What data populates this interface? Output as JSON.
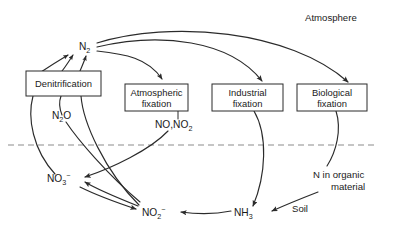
{
  "figure": {
    "canvas": {
      "width": 393,
      "height": 237
    },
    "background_color": "#ffffff",
    "line_color": "#2b2b2b",
    "boundary_color": "#8c8c8c"
  },
  "zones": {
    "atmosphere": {
      "label": "Atmosphere",
      "x": 305,
      "y": 21
    },
    "soil": {
      "label": "Soil",
      "x": 292,
      "y": 212
    }
  },
  "boundary": {
    "name": "atmosphere-soil-boundary",
    "style": "dashed",
    "y": 145,
    "x_start": 8,
    "x_end": 376
  },
  "process_boxes": [
    {
      "id": "denitrification",
      "lines": [
        "Denitrification"
      ],
      "x": 26,
      "y": 71,
      "w": 75,
      "h": 25
    },
    {
      "id": "atmospheric-fixation",
      "lines": [
        "Atmospheric",
        "fixation"
      ],
      "x": 125,
      "y": 84,
      "w": 63,
      "h": 27
    },
    {
      "id": "industrial-fixation",
      "lines": [
        "Industrial",
        "fixation"
      ],
      "x": 212,
      "y": 84,
      "w": 71,
      "h": 27
    },
    {
      "id": "biological-fixation",
      "lines": [
        "Biological",
        "fixation"
      ],
      "x": 297,
      "y": 84,
      "w": 70,
      "h": 27
    }
  ],
  "species": [
    {
      "id": "n2",
      "base": "N",
      "sub": "2",
      "sup": "",
      "x": 79,
      "y": 50
    },
    {
      "id": "n2o",
      "base": "N",
      "sub": "2",
      "sup": "",
      "tail": "O",
      "x": 52,
      "y": 119
    },
    {
      "id": "no-no2",
      "base": "NO,NO",
      "sub": "2",
      "sup": "",
      "x": 155,
      "y": 128
    },
    {
      "id": "no3",
      "base": "NO",
      "sub": "3",
      "sup": "−",
      "x": 47,
      "y": 182
    },
    {
      "id": "no2",
      "base": "NO",
      "sub": "2",
      "sup": "−",
      "x": 142,
      "y": 216
    },
    {
      "id": "nh3",
      "base": "NH",
      "sub": "3",
      "sup": "",
      "x": 234,
      "y": 216
    }
  ],
  "organic": {
    "id": "n-in-organic-material",
    "line1": "N in organic",
    "line2": "material",
    "x": 313,
    "y": 178
  },
  "flows": [
    {
      "id": "n2-to-atmospheric-fixation",
      "from": "n2",
      "to": "atmospheric-fixation"
    },
    {
      "id": "n2-to-industrial-fixation",
      "from": "n2",
      "to": "industrial-fixation"
    },
    {
      "id": "n2-to-biological-fixation",
      "from": "n2",
      "to": "biological-fixation"
    },
    {
      "id": "denitrification-to-n2-a",
      "from": "denitrification",
      "to": "n2"
    },
    {
      "id": "denitrification-to-n2-b",
      "from": "denitrification",
      "to": "n2"
    },
    {
      "id": "denitrification-to-n2-c",
      "from": "denitrification",
      "to": "n2"
    },
    {
      "id": "denitrification-to-no3",
      "from": "denitrification",
      "to": "no3"
    },
    {
      "id": "denitrification-n2o-branch",
      "from": "denitrification",
      "to": "no2"
    },
    {
      "id": "denitrification-to-no2",
      "from": "denitrification",
      "to": "no2"
    },
    {
      "id": "atmospheric-fixation-to-no3",
      "from": "no-no2",
      "to": "no3"
    },
    {
      "id": "industrial-fixation-to-nh3",
      "from": "industrial-fixation",
      "to": "nh3"
    },
    {
      "id": "biological-fixation-to-organic",
      "from": "biological-fixation",
      "to": "n-in-organic-material"
    },
    {
      "id": "organic-to-nh3",
      "from": "n-in-organic-material",
      "to": "nh3"
    },
    {
      "id": "nh3-to-no2",
      "from": "nh3",
      "to": "no2"
    },
    {
      "id": "no2-to-no3",
      "from": "no2",
      "to": "no3"
    },
    {
      "id": "no3-to-no2",
      "from": "no3",
      "to": "no2"
    }
  ]
}
